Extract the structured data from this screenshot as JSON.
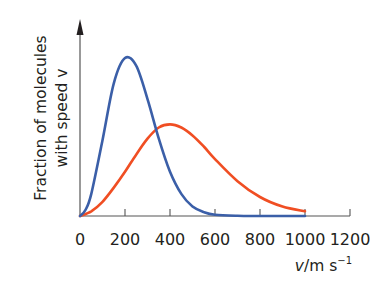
{
  "chart_data": {
    "type": "line",
    "title": "",
    "xlabel": "v/m s^-1",
    "xlabel_parts": {
      "var": "v",
      "unit": "/m s",
      "exp": "−1"
    },
    "ylabel_lines": [
      "Fraction of molecules",
      "with speed v"
    ],
    "xlim": [
      0,
      1200
    ],
    "xticks": [
      0,
      200,
      400,
      600,
      800,
      1000,
      1200
    ],
    "xtick_labels": [
      "0",
      "200",
      "400",
      "600",
      "800",
      "1000",
      "1200"
    ],
    "y_axis": {
      "ticks": false,
      "arrow": true,
      "units": "relative"
    },
    "grid": false,
    "legend": null,
    "series": [
      {
        "name": "lower temperature (narrow distribution)",
        "color": "#3b5fa8",
        "peak_v": 200,
        "peak_relative_height": 1.0,
        "x": [
          0,
          25,
          50,
          100,
          150,
          200,
          250,
          300,
          350,
          400,
          450,
          500,
          550,
          600,
          700,
          800,
          1000
        ],
        "y": [
          0.0,
          0.04,
          0.14,
          0.48,
          0.84,
          1.0,
          0.95,
          0.74,
          0.49,
          0.28,
          0.14,
          0.06,
          0.025,
          0.008,
          0.001,
          0.0,
          0.0
        ]
      },
      {
        "name": "higher temperature (broad distribution)",
        "color": "#f04e23",
        "peak_v": 400,
        "peak_relative_height": 0.58,
        "x": [
          0,
          50,
          100,
          150,
          200,
          250,
          300,
          350,
          400,
          450,
          500,
          550,
          600,
          700,
          800,
          900,
          1000
        ],
        "y": [
          0.0,
          0.03,
          0.09,
          0.18,
          0.28,
          0.39,
          0.49,
          0.56,
          0.58,
          0.56,
          0.51,
          0.44,
          0.36,
          0.22,
          0.12,
          0.06,
          0.03
        ]
      }
    ]
  }
}
